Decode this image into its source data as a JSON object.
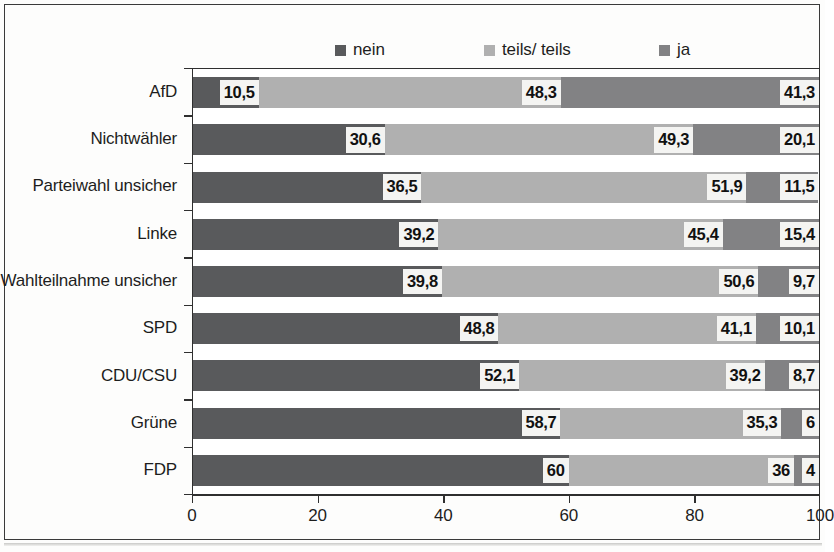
{
  "chart_data": {
    "type": "bar",
    "subtype": "horizontal-stacked-100",
    "title": "",
    "xlabel": "",
    "ylabel": "",
    "xlim": [
      0,
      100
    ],
    "xticks": [
      0,
      20,
      40,
      60,
      80,
      100
    ],
    "xtick_labels": [
      "0",
      "20",
      "40",
      "60",
      "80",
      "100"
    ],
    "grid": false,
    "legend_position": "top",
    "categories": [
      "AfD",
      "Nichtwähler",
      "Parteiwahl unsicher",
      "Linke",
      "Wahlteilnahme unsicher",
      "SPD",
      "CDU/CSU",
      "Grüne",
      "FDP"
    ],
    "series": [
      {
        "name": "nein",
        "color": "#595a5c",
        "values": [
          10.5,
          30.6,
          36.5,
          39.2,
          39.8,
          48.8,
          52.1,
          58.7,
          60
        ],
        "labels": [
          "10,5",
          "30,6",
          "36,5",
          "39,2",
          "39,8",
          "48,8",
          "52,1",
          "58,7",
          "60"
        ]
      },
      {
        "name": "teils/ teils",
        "color": "#b0b0b0",
        "values": [
          48.3,
          49.3,
          51.9,
          45.4,
          50.6,
          41.1,
          39.2,
          35.3,
          36
        ],
        "labels": [
          "48,3",
          "49,3",
          "51,9",
          "45,4",
          "50,6",
          "41,1",
          "39,2",
          "35,3",
          "36"
        ]
      },
      {
        "name": "ja",
        "color": "#828284",
        "values": [
          41.3,
          20.1,
          11.5,
          15.4,
          9.7,
          10.1,
          8.7,
          6,
          4
        ],
        "labels": [
          "41,3",
          "20,1",
          "11,5",
          "15,4",
          "9,7",
          "10,1",
          "8,7",
          "6",
          "4"
        ]
      }
    ]
  },
  "legend": {
    "items": [
      {
        "label": "nein",
        "color": "#595a5c"
      },
      {
        "label": "teils/ teils",
        "color": "#b0b0b0"
      },
      {
        "label": "ja",
        "color": "#828284"
      }
    ]
  },
  "axis": {
    "x_labels": [
      "0",
      "20",
      "40",
      "60",
      "80",
      "100"
    ]
  }
}
